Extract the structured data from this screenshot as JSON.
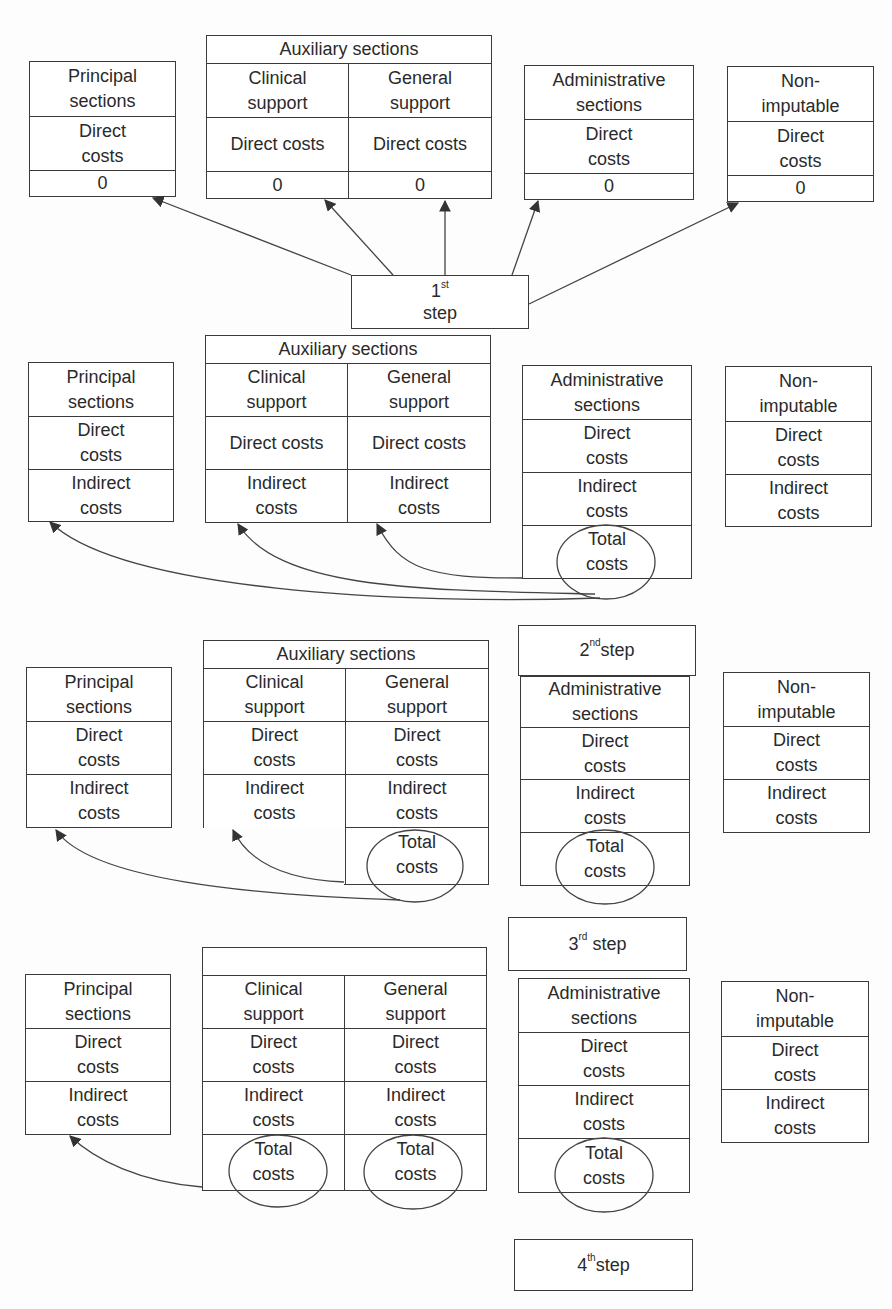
{
  "diagram": {
    "row1": {
      "principal": {
        "title": "Principal sections",
        "direct": "Direct costs",
        "value": "0"
      },
      "auxiliary": {
        "title": "Auxiliary sections",
        "clinical": {
          "title": "Clinical support",
          "direct": "Direct costs",
          "value": "0"
        },
        "general": {
          "title": "General support",
          "direct": "Direct costs",
          "value": "0"
        }
      },
      "administrative": {
        "title": "Administrative sections",
        "direct": "Direct costs",
        "value": "0"
      },
      "nonimputable": {
        "title": "Non-imputable",
        "direct": "Direct costs",
        "value": "0"
      },
      "step": {
        "num": "1",
        "sup": "st",
        "word": "step"
      }
    },
    "row2": {
      "principal": {
        "title": "Principal sections",
        "direct": "Direct costs",
        "indirect": "Indirect costs"
      },
      "auxiliary": {
        "title": "Auxiliary sections",
        "clinical": {
          "title": "Clinical support",
          "direct": "Direct costs",
          "indirect": "Indirect costs"
        },
        "general": {
          "title": "General support",
          "direct": "Direct costs",
          "indirect": "Indirect costs"
        }
      },
      "administrative": {
        "title": "Administrative sections",
        "direct": "Direct costs",
        "indirect": "Indirect costs",
        "total": "Total costs"
      },
      "nonimputable": {
        "title": "Non-imputable",
        "direct": "Direct costs",
        "indirect": "Indirect costs"
      },
      "step": {
        "num": "2",
        "sup": "nd",
        "word": "step"
      }
    },
    "row3": {
      "principal": {
        "title": "Principal sections",
        "direct": "Direct costs",
        "indirect": "Indirect costs"
      },
      "auxiliary": {
        "title": "Auxiliary sections",
        "clinical": {
          "title": "Clinical support",
          "direct": "Direct costs",
          "indirect": "Indirect costs"
        },
        "general": {
          "title": "General support",
          "direct": "Direct costs",
          "indirect": "Indirect costs",
          "total": "Total costs"
        }
      },
      "administrative": {
        "title": "Administrative sections",
        "direct": "Direct costs",
        "indirect": "Indirect costs",
        "total": "Total costs"
      },
      "nonimputable": {
        "title": "Non-imputable",
        "direct": "Direct costs",
        "indirect": "Indirect costs"
      },
      "step": {
        "num": "3",
        "sup": "rd",
        "word": "step"
      }
    },
    "row4": {
      "principal": {
        "title": "Principal sections",
        "direct": "Direct costs",
        "indirect": "Indirect costs"
      },
      "auxiliary": {
        "title": "",
        "clinical": {
          "title": "Clinical support",
          "direct": "Direct costs",
          "indirect": "Indirect costs",
          "total": "Total costs"
        },
        "general": {
          "title": "General support",
          "direct": "Direct costs",
          "indirect": "Indirect costs",
          "total": "Total costs"
        }
      },
      "administrative": {
        "title": "Administrative sections",
        "direct": "Direct costs",
        "indirect": "Indirect costs",
        "total": "Total costs"
      },
      "nonimputable": {
        "title": "Non-imputable",
        "direct": "Direct costs",
        "indirect": "Indirect costs"
      },
      "step": {
        "num": "4",
        "sup": "th",
        "word": "step"
      }
    }
  }
}
